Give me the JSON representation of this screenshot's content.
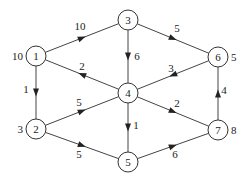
{
  "diagram": {
    "type": "directed-weighted-graph",
    "nodes": [
      {
        "id": "1",
        "label": "1",
        "x": 36,
        "y": 56,
        "side_value": "10",
        "side": "left"
      },
      {
        "id": "2",
        "label": "2",
        "x": 36,
        "y": 129,
        "side_value": "3",
        "side": "left"
      },
      {
        "id": "3",
        "label": "3",
        "x": 128,
        "y": 20,
        "side_value": null,
        "side": null
      },
      {
        "id": "4",
        "label": "4",
        "x": 128,
        "y": 93,
        "side_value": null,
        "side": null
      },
      {
        "id": "5",
        "label": "5",
        "x": 128,
        "y": 162,
        "side_value": null,
        "side": null
      },
      {
        "id": "6",
        "label": "6",
        "x": 218,
        "y": 57,
        "side_value": "5",
        "side": "right"
      },
      {
        "id": "7",
        "label": "7",
        "x": 218,
        "y": 130,
        "side_value": "8",
        "side": "right"
      }
    ],
    "edges": [
      {
        "from": "1",
        "to": "3",
        "weight": "10",
        "lx": 80,
        "ly": 30
      },
      {
        "from": "4",
        "to": "1",
        "weight": "2",
        "lx": 82,
        "ly": 70
      },
      {
        "from": "1",
        "to": "2",
        "weight": "1",
        "lx": 26,
        "ly": 93
      },
      {
        "from": "3",
        "to": "4",
        "weight": "6",
        "lx": 137,
        "ly": 60
      },
      {
        "from": "3",
        "to": "6",
        "weight": "5",
        "lx": 177,
        "ly": 32
      },
      {
        "from": "6",
        "to": "4",
        "weight": "3",
        "lx": 171,
        "ly": 72
      },
      {
        "from": "2",
        "to": "4",
        "weight": "5",
        "lx": 79,
        "ly": 106
      },
      {
        "from": "2",
        "to": "5",
        "weight": "5",
        "lx": 79,
        "ly": 158
      },
      {
        "from": "4",
        "to": "5",
        "weight": "1",
        "lx": 136,
        "ly": 129
      },
      {
        "from": "4",
        "to": "7",
        "weight": "2",
        "lx": 177,
        "ly": 107
      },
      {
        "from": "5",
        "to": "7",
        "weight": "6",
        "lx": 175,
        "ly": 158
      },
      {
        "from": "7",
        "to": "6",
        "weight": "4",
        "lx": 224,
        "ly": 94
      }
    ]
  }
}
